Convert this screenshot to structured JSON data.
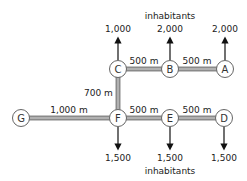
{
  "diagram": {
    "colors": {
      "road": "#8a8a8a",
      "road_center": "#d8d8d8",
      "node_stroke": "#666666",
      "arrow": "#111111"
    },
    "nodes": [
      {
        "id": "A",
        "label": "A",
        "x": 225,
        "y": 69
      },
      {
        "id": "B",
        "label": "B",
        "x": 170,
        "y": 69
      },
      {
        "id": "C",
        "label": "C",
        "x": 118,
        "y": 69
      },
      {
        "id": "D",
        "label": "D",
        "x": 224,
        "y": 118
      },
      {
        "id": "E",
        "label": "E",
        "x": 170,
        "y": 118
      },
      {
        "id": "F",
        "label": "F",
        "x": 118,
        "y": 118
      },
      {
        "id": "G",
        "label": "G",
        "x": 21,
        "y": 118
      }
    ],
    "edges": [
      {
        "from": "C",
        "to": "B",
        "distance": "500 m"
      },
      {
        "from": "B",
        "to": "A",
        "distance": "500 m"
      },
      {
        "from": "C",
        "to": "F",
        "distance": "700 m"
      },
      {
        "from": "G",
        "to": "F",
        "distance": "1,000 m"
      },
      {
        "from": "F",
        "to": "E",
        "distance": "500 m"
      },
      {
        "from": "E",
        "to": "D",
        "distance": "500 m"
      }
    ],
    "populations": [
      {
        "node": "C",
        "value": "1,000",
        "direction": "up"
      },
      {
        "node": "B",
        "value": "2,000",
        "direction": "up"
      },
      {
        "node": "A",
        "value": "2,000",
        "direction": "up"
      },
      {
        "node": "F",
        "value": "1,500",
        "direction": "down"
      },
      {
        "node": "E",
        "value": "1,500",
        "direction": "down"
      },
      {
        "node": "D",
        "value": "1,500",
        "direction": "down"
      }
    ],
    "unit_label_top": "inhabitants",
    "unit_label_bottom": "inhabitants"
  }
}
